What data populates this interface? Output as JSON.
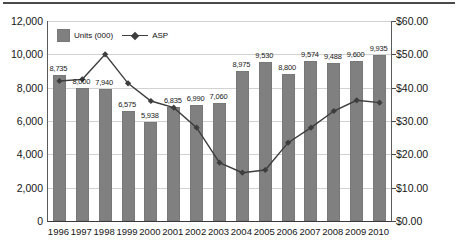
{
  "chart_data": {
    "type": "bar",
    "title": "",
    "subtitle": "",
    "xlabel": "",
    "ylabel": "",
    "y2label": "",
    "grid": true,
    "legend_position": "top-left",
    "categories": [
      "1996",
      "1997",
      "1998",
      "1999",
      "2000",
      "2001",
      "2002",
      "2003",
      "2004",
      "2005",
      "2006",
      "2007",
      "2008",
      "2009",
      "2010"
    ],
    "ylim": [
      0,
      12000
    ],
    "y2lim": [
      0,
      60
    ],
    "ytick_labels": [
      "12,000",
      "10,000",
      "8,000",
      "6,000",
      "4,000",
      "2,000",
      "0"
    ],
    "ytick_values": [
      12000,
      10000,
      8000,
      6000,
      4000,
      2000,
      0
    ],
    "y2tick_labels": [
      "$60.00",
      "$50.00",
      "$40.00",
      "$30.00",
      "$20.00",
      "$10.00",
      "$0.00"
    ],
    "y2tick_values": [
      60,
      50,
      40,
      30,
      20,
      10,
      0
    ],
    "series": [
      {
        "name": "Units (000)",
        "type": "bar",
        "axis": "left",
        "color": "#808080",
        "values": [
          8735,
          8000,
          7940,
          6575,
          5938,
          6835,
          6990,
          7060,
          8975,
          9530,
          8800,
          9574,
          9488,
          9600,
          9935
        ],
        "data_labels": [
          "8,735",
          "8,000",
          "7,940",
          "6,575",
          "5,938",
          "6,835",
          "6,990",
          "7,060",
          "8,975",
          "9,530",
          "8,800",
          "9,574",
          "9,488",
          "9,600",
          "9,935"
        ]
      },
      {
        "name": "ASP",
        "type": "line",
        "axis": "right",
        "color": "#3d3d3d",
        "values": [
          42.0,
          42.5,
          50.0,
          41.3,
          36.0,
          34.0,
          28.0,
          17.5,
          14.5,
          15.3,
          23.5,
          28.0,
          33.0,
          36.2,
          35.5
        ]
      }
    ]
  },
  "legend": {
    "items": [
      {
        "label": "Units (000)",
        "marker": "square-swatch"
      },
      {
        "label": "ASP",
        "marker": "line-diamond"
      }
    ]
  },
  "colors": {
    "bar_fill": "#808080",
    "line_stroke": "#3d3d3d",
    "gridline": "#d2d2d2",
    "axis": "#4a4a4a",
    "text": "#161616",
    "background": "#ffffff"
  }
}
